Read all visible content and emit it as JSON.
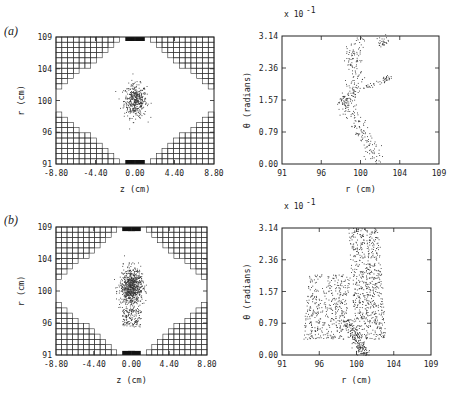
{
  "figure": {
    "panels": [
      {
        "id": "a",
        "label": "(a)"
      },
      {
        "id": "b",
        "label": "(b)"
      }
    ]
  },
  "colors": {
    "ink": "#222222",
    "background": "#ffffff",
    "grid_line": "#333333",
    "fill_dark": "#111111",
    "dots": "#333333"
  },
  "chart_data": [
    {
      "panel": "(a)",
      "position": "left",
      "type": "scatter",
      "title": "",
      "xlabel": "z (cm)",
      "ylabel": "r (cm)",
      "x_ticks": [
        "-8.80",
        "-4.40",
        "0.00",
        "4.40",
        "8.80"
      ],
      "y_ticks": [
        "91",
        "96",
        "100",
        "104",
        "109"
      ],
      "xlim": [
        -8.8,
        8.8
      ],
      "ylim": [
        91,
        109
      ],
      "grid": false,
      "description": "cross-section of cell grid with stepped mesh blocks in corners; compact particle cloud centered near z=0, r=100",
      "cloud": {
        "center_z": 0.0,
        "center_r": 100.0,
        "spread_z": 1.4,
        "spread_r": 2.6,
        "n_points": 420
      }
    },
    {
      "panel": "(a)",
      "position": "right",
      "type": "scatter",
      "title": "",
      "xlabel": "r (cm)",
      "ylabel": "θ (radians)",
      "scale_note": "x 10^-1",
      "x_ticks": [
        "91",
        "96",
        "100",
        "104",
        "109"
      ],
      "y_ticks": [
        "0.00",
        "0.79",
        "1.57",
        "2.36",
        "3.14"
      ],
      "xlim": [
        91,
        109
      ],
      "ylim": [
        0,
        3.14
      ],
      "grid": false,
      "description": "thin zig-zag band of points: r≈101-102 at θ=0, r≈98 at θ=1.57, r≈99 at θ=3.14 with branch to r≈103 near θ=2.0",
      "path": [
        [
          102,
          0.05
        ],
        [
          101,
          0.5
        ],
        [
          99.8,
          0.9
        ],
        [
          98.5,
          1.3
        ],
        [
          98,
          1.57
        ],
        [
          99,
          1.75
        ],
        [
          99.5,
          2.2
        ],
        [
          99,
          2.6
        ],
        [
          99.5,
          3.1
        ]
      ],
      "branch": [
        [
          100,
          1.85
        ],
        [
          102.5,
          2.05
        ],
        [
          103.3,
          2.15
        ]
      ]
    },
    {
      "panel": "(b)",
      "position": "left",
      "type": "scatter",
      "title": "",
      "xlabel": "z (cm)",
      "ylabel": "r (cm)",
      "x_ticks": [
        "-8.80",
        "-4.40",
        "0.00",
        "4.40",
        "8.80"
      ],
      "y_ticks": [
        "91",
        "96",
        "100",
        "104",
        "109"
      ],
      "xlim": [
        -8.8,
        8.8
      ],
      "ylim": [
        91,
        109
      ],
      "grid": false,
      "description": "denser, larger particle cloud centered near z=0, r=100.5 with a tail extending down to r≈95",
      "cloud": {
        "center_z": 0.0,
        "center_r": 100.5,
        "spread_z": 1.5,
        "spread_r": 3.0,
        "n_points": 900
      }
    },
    {
      "panel": "(b)",
      "position": "right",
      "type": "scatter",
      "title": "",
      "xlabel": "r (cm)",
      "ylabel": "θ (radians)",
      "scale_note": "x 10^-1",
      "x_ticks": [
        "91",
        "96",
        "100",
        "104",
        "109"
      ],
      "y_ticks": [
        "0.00",
        "0.79",
        "1.57",
        "2.36",
        "3.14"
      ],
      "xlim": [
        91,
        109
      ],
      "ylim": [
        0,
        3.14
      ],
      "grid": false,
      "description": "broad scattered region: left lobe r≈94-99 θ 0.4-2.0, right lobe r≈100-103 θ 0.5-3.14, diagonal band r≈99-101 θ 0-0.9"
    }
  ],
  "axes": {
    "left": {
      "xlabel": "z (cm)",
      "ylabel": "r (cm)",
      "x_ticks": [
        "-8.80",
        "-4.40",
        "0.00",
        "4.40",
        "8.80"
      ],
      "y_ticks": [
        "109",
        "104",
        "100",
        "96",
        "91"
      ]
    },
    "right": {
      "xlabel": "r (cm)",
      "ylabel": "θ (radians)",
      "scale_note_base": "x 10",
      "scale_note_exp": "-1",
      "x_ticks": [
        "91",
        "96",
        "100",
        "104",
        "109"
      ],
      "y_ticks": [
        "3.14",
        "2.36",
        "1.57",
        "0.79",
        "0.00"
      ]
    }
  }
}
